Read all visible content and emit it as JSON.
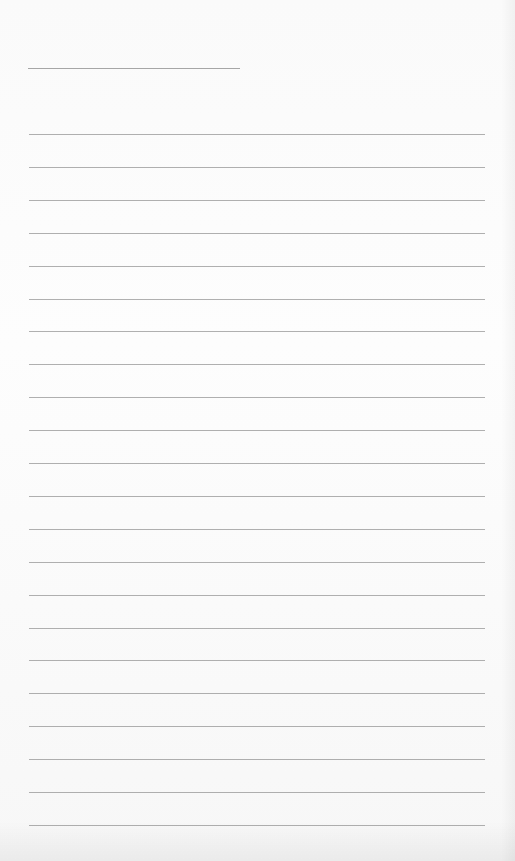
{
  "page": {
    "type": "lined-paper",
    "background_color": "#fbfbfb",
    "line_color": "#8f8f8f",
    "header_line": {
      "x": 28,
      "y": 68,
      "width": 212
    },
    "rules": {
      "count": 22,
      "start_y": 134,
      "spacing": 32.9,
      "x": 29,
      "width": 456
    }
  }
}
